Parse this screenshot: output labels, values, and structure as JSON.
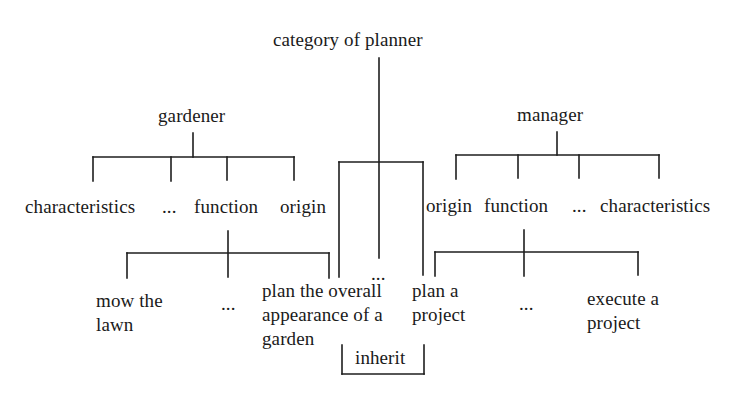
{
  "diagram": {
    "title": "category of planner",
    "inherit_label": "inherit",
    "center_ellipsis": "...",
    "gardener": {
      "label": "gardener",
      "attributes": [
        "characteristics",
        "...",
        "function",
        "origin"
      ],
      "functions": {
        "items": [
          {
            "lines": [
              "mow the",
              "lawn"
            ]
          },
          {
            "lines": [
              "..."
            ]
          },
          {
            "lines": [
              "plan the overall",
              "appearance of a",
              "garden"
            ]
          }
        ]
      }
    },
    "manager": {
      "label": "manager",
      "attributes": [
        "origin",
        "function",
        "...",
        "characteristics"
      ],
      "functions": {
        "items": [
          {
            "lines": [
              "plan a",
              "project"
            ]
          },
          {
            "lines": [
              "..."
            ]
          },
          {
            "lines": [
              "execute a",
              "project"
            ]
          }
        ]
      }
    },
    "line_color": "#1e1e1e",
    "edges": [
      {
        "from": "category of planner",
        "to": "inherit-branch"
      },
      {
        "from": "gardener",
        "to": "characteristics"
      },
      {
        "from": "gardener",
        "to": "..."
      },
      {
        "from": "gardener",
        "to": "function"
      },
      {
        "from": "gardener",
        "to": "origin"
      },
      {
        "from": "manager",
        "to": "origin"
      },
      {
        "from": "manager",
        "to": "function"
      },
      {
        "from": "manager",
        "to": "..."
      },
      {
        "from": "manager",
        "to": "characteristics"
      },
      {
        "from": "gardener.function",
        "to": "mow the lawn"
      },
      {
        "from": "gardener.function",
        "to": "..."
      },
      {
        "from": "gardener.function",
        "to": "plan the overall appearance of a garden"
      },
      {
        "from": "manager.function",
        "to": "plan a project"
      },
      {
        "from": "manager.function",
        "to": "..."
      },
      {
        "from": "manager.function",
        "to": "execute a project"
      }
    ]
  }
}
